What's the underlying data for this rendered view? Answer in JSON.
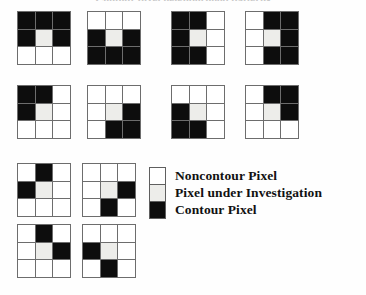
{
  "figure": {
    "title": "Contour pixel neighborhood patterns",
    "cell_colors": {
      "noncontour": "#ffffff",
      "under_investigation": "#ededea",
      "contour": "#0d0d0d",
      "grid_line": "#6d6d6d"
    }
  },
  "legend": {
    "items": [
      {
        "swatch": "w",
        "label": "Noncontour Pixel"
      },
      {
        "swatch": "g",
        "label": "Pixel under Investigation"
      },
      {
        "swatch": "k",
        "label": "Contour Pixel"
      }
    ]
  },
  "patterns": [
    {
      "id": "pattern-1",
      "name": "top-bar-and-sides",
      "x": 17,
      "y": 11,
      "cells": [
        "k",
        "k",
        "k",
        "k",
        "g",
        "k",
        "w",
        "w",
        "w"
      ]
    },
    {
      "id": "pattern-2",
      "name": "bottom-bar-and-sides",
      "x": 87,
      "y": 11,
      "cells": [
        "w",
        "w",
        "w",
        "k",
        "g",
        "k",
        "k",
        "k",
        "k"
      ]
    },
    {
      "id": "pattern-3",
      "name": "left-bar-and-top-bottom",
      "x": 171,
      "y": 11,
      "cells": [
        "k",
        "k",
        "w",
        "k",
        "g",
        "w",
        "k",
        "k",
        "w"
      ]
    },
    {
      "id": "pattern-4",
      "name": "right-bar-and-top-bottom",
      "x": 245,
      "y": 11,
      "cells": [
        "w",
        "k",
        "k",
        "w",
        "g",
        "k",
        "w",
        "k",
        "k"
      ]
    },
    {
      "id": "pattern-5",
      "name": "upper-left-corner",
      "x": 17,
      "y": 85,
      "cells": [
        "k",
        "k",
        "w",
        "k",
        "g",
        "w",
        "w",
        "w",
        "w"
      ]
    },
    {
      "id": "pattern-6",
      "name": "lower-right-corner",
      "x": 87,
      "y": 85,
      "cells": [
        "w",
        "w",
        "w",
        "w",
        "g",
        "k",
        "w",
        "k",
        "k"
      ]
    },
    {
      "id": "pattern-7",
      "name": "lower-left-corner",
      "x": 171,
      "y": 85,
      "cells": [
        "w",
        "w",
        "w",
        "k",
        "g",
        "w",
        "k",
        "k",
        "w"
      ]
    },
    {
      "id": "pattern-8",
      "name": "upper-right-corner",
      "x": 245,
      "y": 85,
      "cells": [
        "w",
        "k",
        "k",
        "w",
        "g",
        "k",
        "w",
        "w",
        "w"
      ]
    },
    {
      "id": "pattern-9",
      "name": "top-and-left-neighbors",
      "x": 17,
      "y": 163,
      "cells": [
        "w",
        "k",
        "w",
        "k",
        "g",
        "w",
        "w",
        "w",
        "w"
      ]
    },
    {
      "id": "pattern-10",
      "name": "right-and-bottom-neighbors",
      "x": 82,
      "y": 163,
      "cells": [
        "w",
        "w",
        "w",
        "w",
        "g",
        "k",
        "w",
        "k",
        "w"
      ]
    },
    {
      "id": "pattern-11",
      "name": "top-and-right-neighbors",
      "x": 17,
      "y": 224,
      "cells": [
        "w",
        "k",
        "w",
        "w",
        "g",
        "k",
        "w",
        "w",
        "w"
      ]
    },
    {
      "id": "pattern-12",
      "name": "left-and-bottom-neighbors",
      "x": 82,
      "y": 224,
      "cells": [
        "w",
        "w",
        "w",
        "k",
        "g",
        "w",
        "w",
        "k",
        "w"
      ]
    }
  ]
}
